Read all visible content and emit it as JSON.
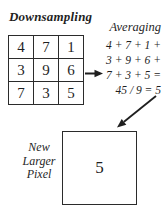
{
  "colors": {
    "ink": "#1f1f1f",
    "border": "#2b2b2b",
    "background": "#ffffff"
  },
  "title": "Downsampling",
  "grid": {
    "rows": [
      [
        "4",
        "7",
        "1"
      ],
      [
        "3",
        "9",
        "6"
      ],
      [
        "7",
        "3",
        "5"
      ]
    ]
  },
  "averaging": {
    "heading": "Averaging",
    "lines": [
      "4 + 7 + 1 +",
      "3 + 9 + 6 +",
      "7 + 3 + 5 =",
      "45 / 9 = 5"
    ]
  },
  "new_pixel": {
    "label_lines": [
      "New",
      "Larger",
      "Pixel"
    ],
    "value": "5"
  },
  "icons": {
    "right_arrow": "arrow-right",
    "diagonal_arrow": "arrow-down-left"
  }
}
